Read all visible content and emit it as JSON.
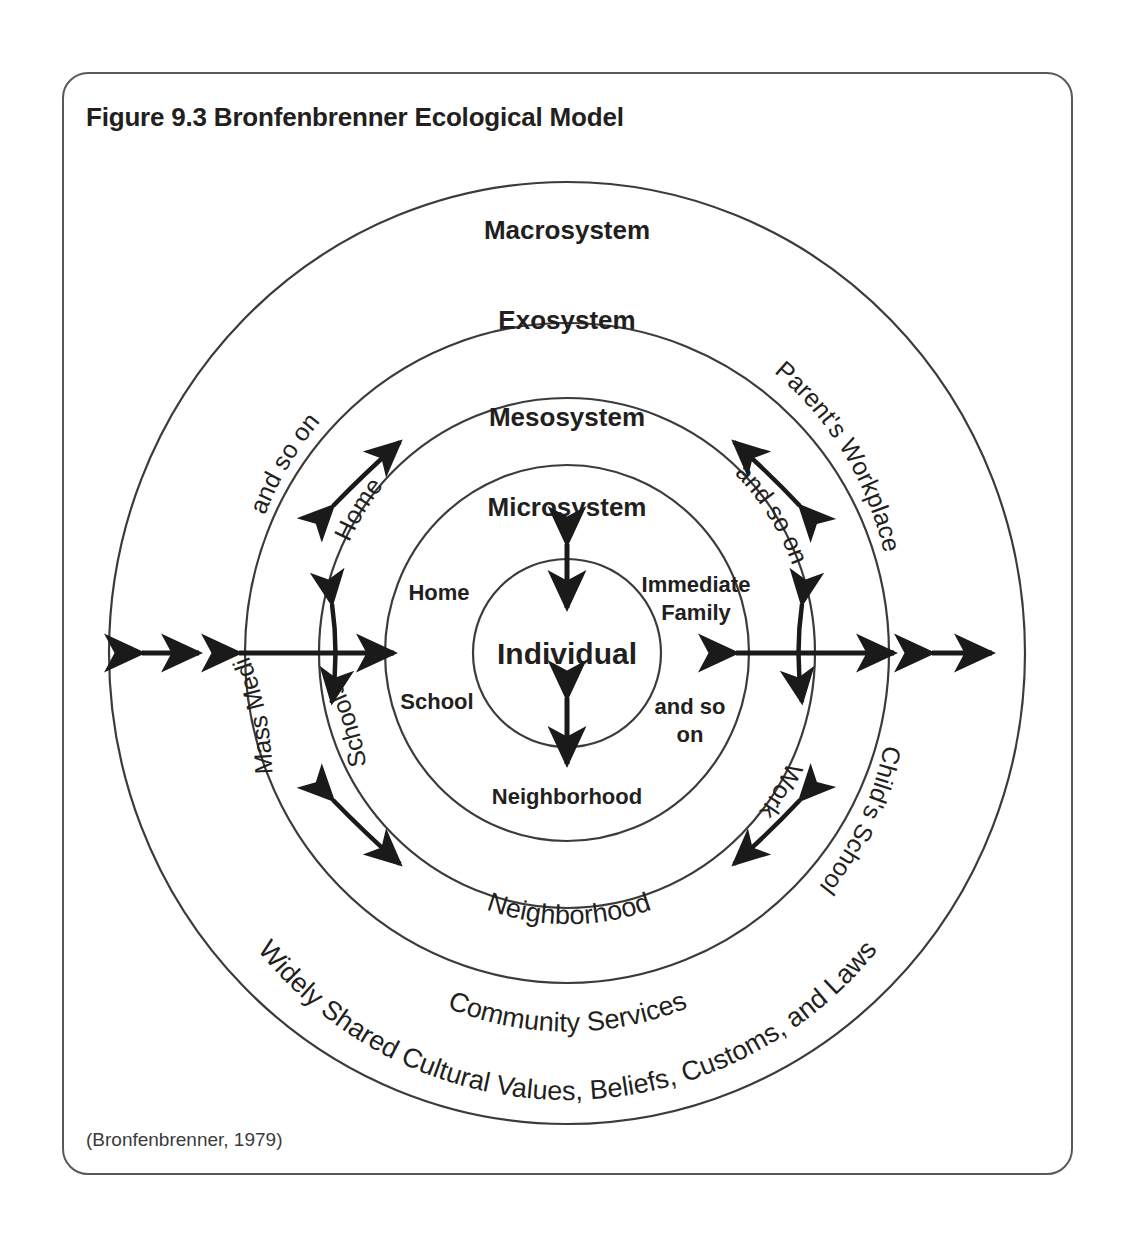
{
  "figure": {
    "title": "Figure 9.3 Bronfenbrenner Ecological Model",
    "citation": "(Bronfenbrenner, 1979)"
  },
  "diagram": {
    "type": "concentric-circles",
    "center_label": "Individual",
    "rings": [
      {
        "name": "microsystem",
        "label": "Microsystem"
      },
      {
        "name": "mesosystem",
        "label": "Mesosystem"
      },
      {
        "name": "exosystem",
        "label": "Exosystem"
      },
      {
        "name": "macrosystem",
        "label": "Macrosystem"
      }
    ],
    "microsystem_items": {
      "home": "Home",
      "school": "School",
      "immediate_family_line1": "Immediate",
      "immediate_family_line2": "Family",
      "and_so_on_line1": "and so",
      "and_so_on_line2": "on",
      "neighborhood": "Neighborhood"
    },
    "mesosystem_items": {
      "home": "Home",
      "schools": "Schools",
      "and_so_on": "and so on",
      "work": "Work",
      "neighborhood": "Neighborhood"
    },
    "exosystem_items": {
      "and_so_on": "and so on",
      "mass_media": "Mass Media",
      "parents_workplace": "Parent's Workplace",
      "childs_school": "Child's School",
      "community_services": "Community Services"
    },
    "macrosystem_items": {
      "cultural_values": "Widely Shared Cultural Values, Beliefs, Customs, and Laws"
    },
    "colors": {
      "stroke": "#3b3b3b",
      "text": "#231f20",
      "arrow": "#1a1a1a",
      "frame": "#58595b",
      "background": "#ffffff"
    }
  }
}
